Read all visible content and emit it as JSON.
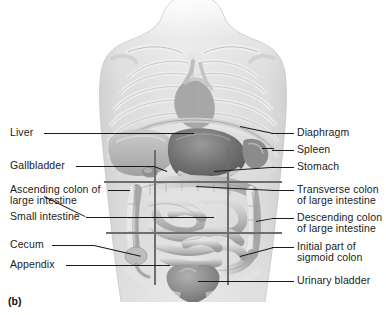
{
  "figure": {
    "caption": "(b)",
    "palette": {
      "background": "#ffffff",
      "skin": "#dcdcdc",
      "bone": "#e9e9e9",
      "organ_light": "#cfcfcf",
      "organ_mid": "#a9a9a9",
      "organ_dark": "#808080",
      "stomach": "#6f6f6f",
      "bladder": "#8a8a8a",
      "leader": "#1b1b1b",
      "grid": "#6e6e6e",
      "text": "#1b1b1b"
    }
  },
  "labels_left": [
    {
      "id": "liver",
      "text": "Liver",
      "lines": [
        "Liver"
      ]
    },
    {
      "id": "gallbladder",
      "text": "Gallbladder",
      "lines": [
        "Gallbladder"
      ]
    },
    {
      "id": "ascending-colon",
      "text": "Ascending colon of large intestine",
      "lines": [
        "Ascending colon of",
        "large intestine"
      ]
    },
    {
      "id": "small-intestine",
      "text": "Small intestine",
      "lines": [
        "Small intestine"
      ]
    },
    {
      "id": "cecum",
      "text": "Cecum",
      "lines": [
        "Cecum"
      ]
    },
    {
      "id": "appendix",
      "text": "Appendix",
      "lines": [
        "Appendix"
      ]
    }
  ],
  "labels_right": [
    {
      "id": "diaphragm",
      "text": "Diaphragm",
      "lines": [
        "Diaphragm"
      ]
    },
    {
      "id": "spleen",
      "text": "Spleen",
      "lines": [
        "Spleen"
      ]
    },
    {
      "id": "stomach",
      "text": "Stomach",
      "lines": [
        "Stomach"
      ]
    },
    {
      "id": "transverse-colon",
      "text": "Transverse colon of large intestine",
      "lines": [
        "Transverse colon",
        "of large intestine"
      ]
    },
    {
      "id": "descending-colon",
      "text": "Descending colon of large intestine",
      "lines": [
        "Descending colon",
        "of large intestine"
      ]
    },
    {
      "id": "sigmoid-colon",
      "text": "Initial part of sigmoid colon",
      "lines": [
        "Initial part of",
        "sigmoid colon"
      ]
    },
    {
      "id": "urinary-bladder",
      "text": "Urinary bladder",
      "lines": [
        "Urinary bladder"
      ]
    }
  ]
}
